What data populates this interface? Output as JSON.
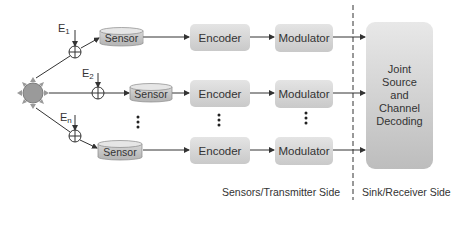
{
  "diagram": {
    "source": {
      "icon": "sun-source-icon"
    },
    "rows": [
      {
        "error_label": "E",
        "error_subscript": "1",
        "sensor_label": "Sensor",
        "encoder_label": "Encoder",
        "modulator_label": "Modulator"
      },
      {
        "error_label": "E",
        "error_subscript": "2",
        "sensor_label": "Sensor",
        "encoder_label": "Encoder",
        "modulator_label": "Modulator"
      },
      {
        "error_label": "E",
        "error_subscript": "n",
        "sensor_label": "Sensor",
        "encoder_label": "Encoder",
        "modulator_label": "Modulator"
      }
    ],
    "ellipsis": "⋮",
    "decoder": {
      "lines": [
        "Joint",
        "Source",
        "and",
        "Channel",
        "Decoding"
      ]
    },
    "sides": {
      "transmitter": "Sensors/Transmitter Side",
      "receiver": "Sink/Receiver Side"
    },
    "colors": {
      "line": "#333333",
      "box_top": "#e4e4e4",
      "box_bottom": "#c9c9c9",
      "source_fill": "#9a9a9a"
    }
  }
}
